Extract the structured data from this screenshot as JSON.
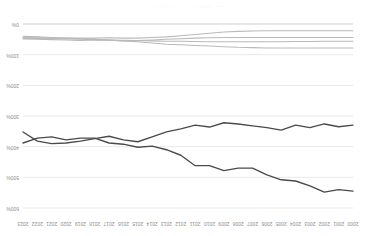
{
  "chart_data": {
    "type": "line",
    "title": "",
    "xlabel": "",
    "ylabel": "",
    "ylim": [
      0,
      600
    ],
    "yticks": [
      0,
      100,
      200,
      300,
      400,
      500,
      600
    ],
    "ytick_labels": [
      "0%",
      "100%",
      "200%",
      "300%",
      "400%",
      "500%",
      "600%"
    ],
    "grid": true,
    "legend_position": "bottom",
    "rotated_180": true,
    "x": [
      2000,
      2001,
      2002,
      2003,
      2004,
      2005,
      2006,
      2007,
      2008,
      2009,
      2010,
      2011,
      2012,
      2013,
      2014,
      2015,
      2016,
      2017,
      2018,
      2019,
      2020,
      2021,
      2022,
      2023
    ],
    "xtick_labels": [
      "2000",
      "2001",
      "2002",
      "2003",
      "2004",
      "2005",
      "2006",
      "2007",
      "2008",
      "2009",
      "2010",
      "2011",
      "2012",
      "2013",
      "2014",
      "2015",
      "2016",
      "2017",
      "2018",
      "2019",
      "2020",
      "2021",
      "2022",
      "2023"
    ],
    "series": [
      {
        "name": "Series 1",
        "color": "#4a4a4a",
        "emphasis": "major",
        "values": [
          545,
          540,
          548,
          528,
          512,
          508,
          492,
          470,
          470,
          478,
          462,
          462,
          428,
          410,
          398,
          402,
          392,
          388,
          372,
          372,
          378,
          368,
          372,
          388
        ]
      },
      {
        "name": "Series 2",
        "color": "#4a4a4a",
        "emphasis": "major",
        "values": [
          330,
          335,
          326,
          338,
          330,
          346,
          338,
          332,
          326,
          322,
          336,
          330,
          342,
          352,
          368,
          384,
          378,
          366,
          374,
          382,
          388,
          390,
          382,
          352
        ]
      },
      {
        "name": "Series 3",
        "color": "#9a9a9a",
        "emphasis": "minor",
        "values": [
          78,
          78,
          78,
          78,
          78,
          78,
          78,
          77,
          76,
          74,
          72,
          70,
          68,
          66,
          62,
          58,
          55,
          52,
          50,
          48,
          46,
          44,
          42,
          40
        ]
      },
      {
        "name": "Series 4",
        "color": "#b5b5b5",
        "emphasis": "minor",
        "values": [
          56,
          56,
          56,
          57,
          57,
          58,
          58,
          58,
          58,
          58,
          58,
          57,
          56,
          56,
          55,
          54,
          53,
          52,
          51,
          50,
          49,
          48,
          47,
          46
        ]
      },
      {
        "name": "Series 5",
        "color": "#c2c2c2",
        "emphasis": "minor",
        "values": [
          44,
          44,
          44,
          44,
          44,
          44,
          44,
          44,
          44,
          44,
          45,
          46,
          48,
          50,
          52,
          54,
          55,
          53,
          52,
          54,
          52,
          51,
          50,
          49
        ]
      },
      {
        "name": "Series 6",
        "color": "#c9c9c9",
        "emphasis": "minor",
        "values": [
          22,
          22,
          22,
          22,
          22,
          22,
          22,
          23,
          24,
          26,
          30,
          34,
          38,
          42,
          44,
          46,
          46,
          45,
          46,
          46,
          46,
          46,
          45,
          44
        ]
      }
    ],
    "legend": [
      {
        "label": "Series 1",
        "color": "#fbfbfb"
      },
      {
        "label": "Series 2",
        "color": "#fbfbfb"
      }
    ]
  }
}
